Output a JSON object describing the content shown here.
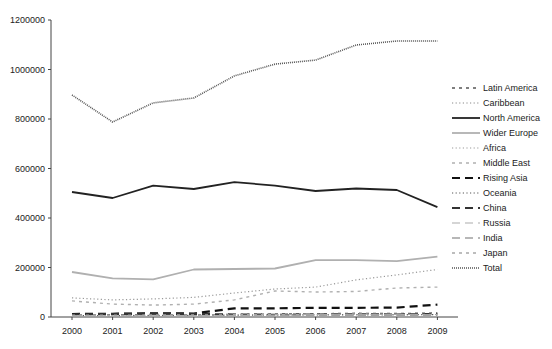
{
  "chart_data": {
    "type": "line",
    "title": "",
    "xlabel": "",
    "ylabel": "",
    "x": [
      "2000",
      "2001",
      "2002",
      "2003",
      "2004",
      "2005",
      "2006",
      "2007",
      "2008",
      "2009"
    ],
    "ylim": [
      0,
      1200000
    ],
    "yticks": [
      0,
      200000,
      400000,
      600000,
      800000,
      1000000,
      1200000
    ],
    "ytick_labels": [
      "0",
      "200000",
      "400000",
      "600000",
      "800000",
      "1000000",
      "1200000"
    ],
    "grid": false,
    "legend_position": "right",
    "series": [
      {
        "name": "Latin America",
        "style": "dash-small",
        "color": "#555555",
        "width": 1.4,
        "values": [
          8000,
          9000,
          10000,
          9000,
          10000,
          12000,
          13000,
          15000,
          14000,
          16000
        ]
      },
      {
        "name": "Caribbean",
        "style": "dot",
        "color": "#888888",
        "width": 1,
        "values": [
          5000,
          5000,
          6000,
          6000,
          7000,
          8000,
          8000,
          9000,
          9000,
          9000
        ]
      },
      {
        "name": "North America",
        "style": "solid",
        "color": "#222222",
        "width": 1.8,
        "values": [
          505000,
          481000,
          531000,
          517000,
          545000,
          531000,
          509000,
          519000,
          513000,
          444000
        ]
      },
      {
        "name": "Wider Europe",
        "style": "solid",
        "color": "#b0b0b0",
        "width": 1.8,
        "values": [
          182000,
          156000,
          152000,
          192000,
          194000,
          196000,
          230000,
          230000,
          226000,
          244000
        ]
      },
      {
        "name": "Africa",
        "style": "dot",
        "color": "#999999",
        "width": 1.2,
        "values": [
          77000,
          69000,
          73000,
          79000,
          97000,
          113000,
          121000,
          150000,
          170000,
          192000
        ]
      },
      {
        "name": "Middle East",
        "style": "dash-small",
        "color": "#b0b0b0",
        "width": 1.4,
        "values": [
          65000,
          52000,
          48000,
          52000,
          69000,
          105000,
          101000,
          103000,
          117000,
          121000
        ]
      },
      {
        "name": "Rising Asia",
        "style": "dash-long",
        "color": "#111111",
        "width": 2.2,
        "values": [
          12000,
          13000,
          15000,
          14000,
          35000,
          35000,
          37000,
          37000,
          38000,
          50000
        ]
      },
      {
        "name": "Oceania",
        "style": "dot",
        "color": "#555555",
        "width": 1,
        "values": [
          6000,
          6000,
          7000,
          7000,
          8000,
          8000,
          9000,
          9000,
          9000,
          10000
        ]
      },
      {
        "name": "China",
        "style": "dash-long",
        "color": "#333333",
        "width": 2.2,
        "values": [
          10000,
          12000,
          14000,
          12000,
          10000,
          9000,
          10000,
          11000,
          10000,
          12000
        ]
      },
      {
        "name": "Russia",
        "style": "dash-long",
        "color": "#c8c8c8",
        "width": 1.4,
        "values": [
          4000,
          4000,
          5000,
          5000,
          6000,
          7000,
          8000,
          8000,
          8000,
          8000
        ]
      },
      {
        "name": "India",
        "style": "dash-long",
        "color": "#a0a0a0",
        "width": 1.4,
        "values": [
          3000,
          3000,
          3000,
          4000,
          4000,
          5000,
          6000,
          6000,
          7000,
          7000
        ]
      },
      {
        "name": "Japan",
        "style": "dash-small",
        "color": "#a8a8a8",
        "width": 1.4,
        "values": [
          7000,
          7000,
          8000,
          8000,
          9000,
          9000,
          10000,
          12000,
          11000,
          10000
        ]
      },
      {
        "name": "Total",
        "style": "dense-dot",
        "color": "#555555",
        "width": 1.6,
        "values": [
          897000,
          788000,
          865000,
          885000,
          974000,
          1022000,
          1038000,
          1099000,
          1115000,
          1115000
        ]
      }
    ]
  },
  "legend": {
    "items": [
      "Latin America",
      "Caribbean",
      "North America",
      "Wider Europe",
      "Africa",
      "Middle East",
      "Rising Asia",
      "Oceania",
      "China",
      "Russia",
      "India",
      "Japan",
      "Total"
    ]
  }
}
